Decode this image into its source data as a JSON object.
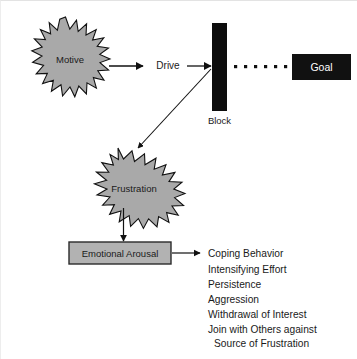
{
  "diagram": {
    "background_color": "#ffffff",
    "nodes": {
      "motive": {
        "label": "Motive",
        "shape": "starburst",
        "fill": "#a9a9a9",
        "stroke": "#1a1a1a"
      },
      "drive": {
        "label": "Drive",
        "shape": "text-label"
      },
      "block": {
        "label": "Block",
        "shape": "vertical-bar",
        "fill": "#0d0d0d"
      },
      "goal": {
        "label": "Goal",
        "shape": "rectangle",
        "fill": "#111111",
        "text_color": "#ffffff"
      },
      "frustration": {
        "label": "Frustration",
        "shape": "starburst",
        "fill": "#a9a9a9",
        "stroke": "#1a1a1a"
      },
      "emotional_arousal": {
        "label": "Emotional Arousal",
        "shape": "rectangle",
        "fill": "#b2b2b2",
        "stroke": "#2b2b2b"
      }
    },
    "dotted_path": {
      "name": "blocked-path-to-goal",
      "dot_count": 6,
      "dot_color": "#111111"
    },
    "outcomes": [
      "Coping Behavior",
      "Intensifying Effort",
      "Persistence",
      "Aggression",
      "Withdrawal of Interest",
      "Join with Others against",
      "Source of Frustration"
    ]
  }
}
